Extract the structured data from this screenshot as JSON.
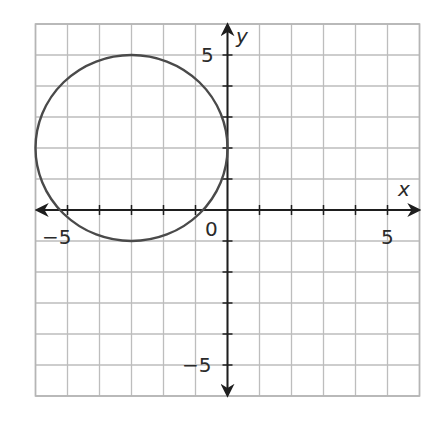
{
  "chart_data": {
    "type": "scatter",
    "title": "",
    "xlabel": "x",
    "ylabel": "y",
    "xlim": [
      -6,
      6
    ],
    "ylim": [
      -6,
      6
    ],
    "grid": true,
    "grid_step": 1,
    "x_tick_labels": [
      {
        "value": -5,
        "label": "−5"
      },
      {
        "value": 0,
        "label": "0"
      },
      {
        "value": 5,
        "label": "5"
      }
    ],
    "y_tick_labels": [
      {
        "value": 5,
        "label": "5"
      },
      {
        "value": -5,
        "label": "−5"
      }
    ],
    "series": [
      {
        "name": "circle",
        "shape": "circle",
        "center": [
          -3,
          2
        ],
        "radius": 3,
        "equation": "(x + 3)^2 + (y - 2)^2 = 9",
        "key_points": [
          [
            -3,
            5
          ],
          [
            -3,
            -1
          ],
          [
            -6,
            2
          ],
          [
            0,
            2
          ]
        ]
      }
    ],
    "legend": null
  },
  "labels": {
    "x_axis": "x",
    "y_axis": "y",
    "origin": "0",
    "x_neg5": "−5",
    "x_pos5": "5",
    "y_pos5": "5",
    "y_neg5": "−5"
  },
  "colors": {
    "grid": "#bdbdbd",
    "axis": "#1e1e1e",
    "curve": "#4a4a4a",
    "background": "#ffffff"
  }
}
